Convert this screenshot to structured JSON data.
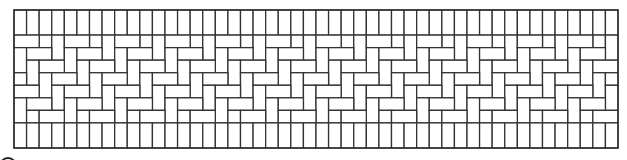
{
  "figure": {
    "line_color": "#333333",
    "background": "#ffffff",
    "frame": {
      "x": 14,
      "y": 10,
      "width": 604,
      "height": 138
    },
    "unit_columns": 48,
    "unit_rows": 11,
    "bands": [
      {
        "name": "top-soldier-course",
        "type": "vertical",
        "rows": 2
      },
      {
        "name": "herringbone-band",
        "type": "herringbone",
        "rows": 7,
        "period": 4
      },
      {
        "name": "bottom-soldier-course",
        "type": "vertical",
        "rows": 2
      }
    ],
    "corner_mark": {
      "cx": 8,
      "cy": 166,
      "r": 8
    }
  }
}
